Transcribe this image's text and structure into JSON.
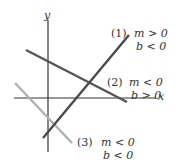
{
  "axes": {
    "x_label": "x",
    "y_label": "y"
  },
  "lines": [
    {
      "id": "1",
      "tag": "(1)",
      "cond1": "m > 0",
      "cond2": "b < 0",
      "color": "#4a4a4a"
    },
    {
      "id": "2",
      "tag": "(2)",
      "cond1": "m < 0",
      "cond2": "b > 0",
      "color": "#555555"
    },
    {
      "id": "3",
      "tag": "(3)",
      "cond1": "m < 0",
      "cond2": "b < 0",
      "color": "#b0b0b0"
    }
  ]
}
